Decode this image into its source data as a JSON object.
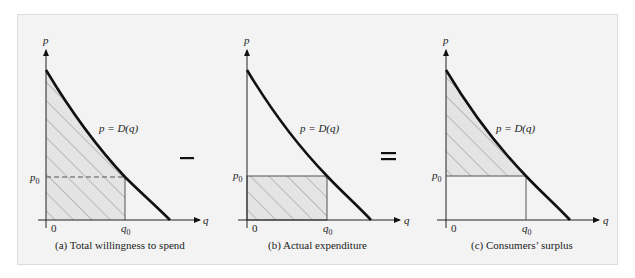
{
  "figure": {
    "panels": [
      {
        "id": "a",
        "caption": "(a) Total willingness to spend",
        "curve_label": "p = D(q)",
        "y_axis": "p",
        "x_axis": "q",
        "origin": "0",
        "p0": "p0",
        "q0": "q0",
        "shaded_region": "area under demand curve from 0 to q0"
      },
      {
        "id": "b",
        "caption": "(b) Actual expenditure",
        "curve_label": "p = D(q)",
        "y_axis": "p",
        "x_axis": "q",
        "origin": "0",
        "p0": "p0",
        "q0": "q0",
        "shaded_region": "rectangle p0 × q0"
      },
      {
        "id": "c",
        "caption": "(c) Consumers’ surplus",
        "curve_label": "p = D(q)",
        "y_axis": "p",
        "x_axis": "q",
        "origin": "0",
        "p0": "p0",
        "q0": "q0",
        "shaded_region": "area between demand curve and p0 from 0 to q0"
      }
    ],
    "operators": [
      "–",
      "="
    ]
  }
}
